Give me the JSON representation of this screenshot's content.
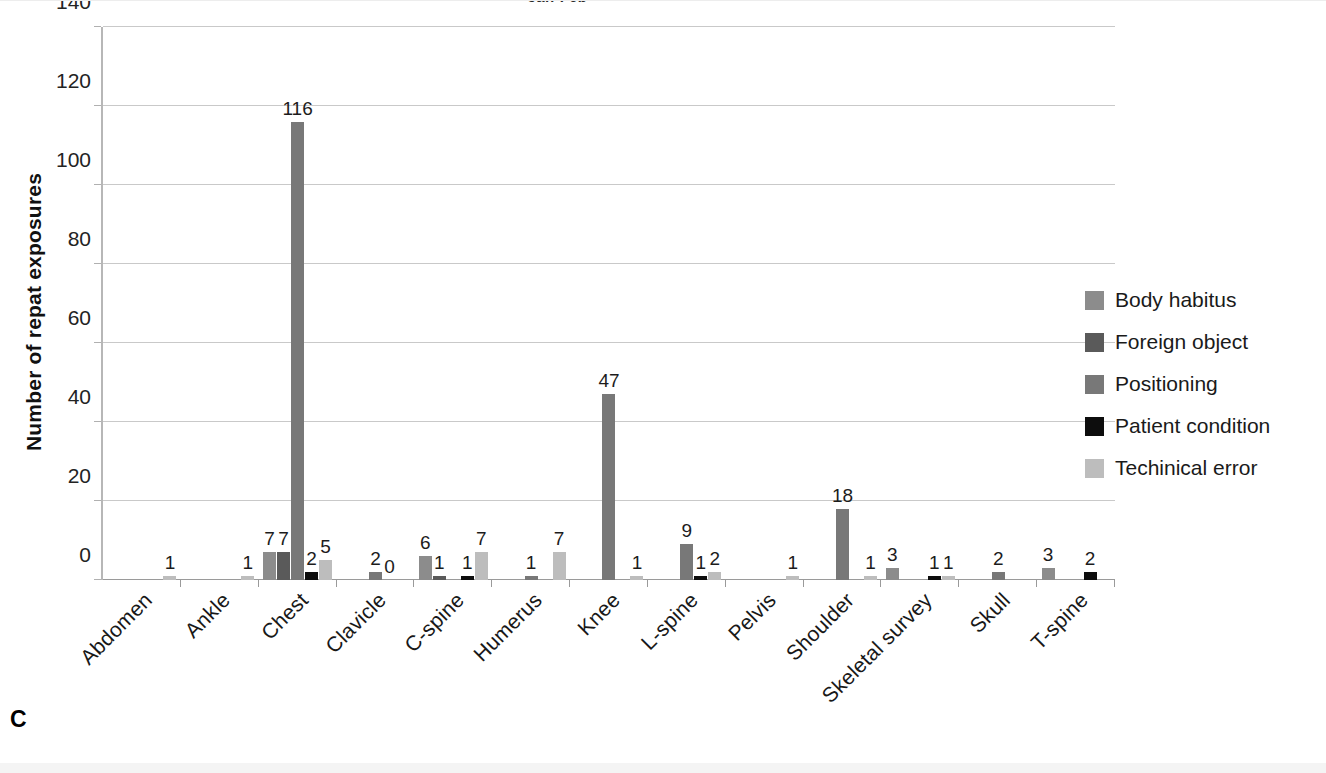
{
  "panel_letter": "C",
  "chart_data": {
    "type": "bar",
    "title": "Jan-Feb",
    "xlabel": "",
    "ylabel": "Number of repat exposures",
    "ylim": [
      0,
      140
    ],
    "yticks": [
      0,
      20,
      40,
      60,
      80,
      100,
      120,
      140
    ],
    "grid": true,
    "legend_position": "right",
    "grouped": true,
    "categories": [
      "Abdomen",
      "Ankle",
      "Chest",
      "Clavicle",
      "C-spine",
      "Humerus",
      "Knee",
      "L-spine",
      "Pelvis",
      "Shoulder",
      "Skeletal survey",
      "Skull",
      "T-spine"
    ],
    "series": [
      {
        "name": "Body habitus",
        "color": "#8c8c8c",
        "values": [
          0,
          0,
          7,
          0,
          6,
          0,
          0,
          0,
          0,
          0,
          3,
          0,
          3
        ]
      },
      {
        "name": "Foreign object",
        "color": "#5a5a5a",
        "values": [
          0,
          0,
          7,
          0,
          1,
          0,
          0,
          0,
          0,
          0,
          0,
          0,
          0
        ]
      },
      {
        "name": "Positioning",
        "color": "#787878",
        "values": [
          0,
          0,
          116,
          2,
          0,
          1,
          47,
          9,
          0,
          18,
          0,
          2,
          0
        ]
      },
      {
        "name": "Patient condition",
        "color": "#0d0d0d",
        "values": [
          0,
          0,
          2,
          0,
          1,
          0,
          0,
          1,
          0,
          0,
          1,
          0,
          2
        ]
      },
      {
        "name": "Techinical error",
        "color": "#bdbdbd",
        "values": [
          1,
          1,
          5,
          0,
          7,
          7,
          1,
          2,
          1,
          1,
          1,
          0,
          0
        ]
      }
    ],
    "bar_labels": [
      {
        "category": "Abdomen",
        "labels": [
          {
            "series": "Techinical error",
            "text": "1"
          }
        ]
      },
      {
        "category": "Ankle",
        "labels": [
          {
            "series": "Techinical error",
            "text": "1"
          }
        ]
      },
      {
        "category": "Chest",
        "labels": [
          {
            "series": "Body habitus",
            "text": "7"
          },
          {
            "series": "Foreign object",
            "text": "7"
          },
          {
            "series": "Positioning",
            "text": "116"
          },
          {
            "series": "Patient condition",
            "text": "2"
          },
          {
            "series": "Techinical error",
            "text": "5"
          }
        ]
      },
      {
        "category": "Clavicle",
        "labels": [
          {
            "series": "Positioning",
            "text": "2"
          },
          {
            "series": "Patient condition",
            "text": "0"
          }
        ]
      },
      {
        "category": "C-spine",
        "labels": [
          {
            "series": "Body habitus",
            "text": "6"
          },
          {
            "series": "Foreign object",
            "text": "1"
          },
          {
            "series": "Patient condition",
            "text": "1"
          },
          {
            "series": "Techinical error",
            "text": "7"
          }
        ]
      },
      {
        "category": "Humerus",
        "labels": [
          {
            "series": "Positioning",
            "text": "1"
          },
          {
            "series": "Techinical error",
            "text": "7"
          }
        ]
      },
      {
        "category": "Knee",
        "labels": [
          {
            "series": "Positioning",
            "text": "47"
          },
          {
            "series": "Techinical error",
            "text": "1"
          }
        ]
      },
      {
        "category": "L-spine",
        "labels": [
          {
            "series": "Positioning",
            "text": "9"
          },
          {
            "series": "Patient condition",
            "text": "1"
          },
          {
            "series": "Techinical error",
            "text": "2"
          }
        ]
      },
      {
        "category": "Pelvis",
        "labels": [
          {
            "series": "Techinical error",
            "text": "1"
          }
        ]
      },
      {
        "category": "Shoulder",
        "labels": [
          {
            "series": "Positioning",
            "text": "18"
          },
          {
            "series": "Techinical error",
            "text": "1"
          }
        ]
      },
      {
        "category": "Skeletal survey",
        "labels": [
          {
            "series": "Body habitus",
            "text": "3"
          },
          {
            "series": "Patient condition",
            "text": "1"
          },
          {
            "series": "Techinical error",
            "text": "1"
          }
        ]
      },
      {
        "category": "Skull",
        "labels": [
          {
            "series": "Positioning",
            "text": "2"
          }
        ]
      },
      {
        "category": "T-spine",
        "labels": [
          {
            "series": "Body habitus",
            "text": "3"
          },
          {
            "series": "Patient condition",
            "text": "2"
          }
        ]
      }
    ]
  }
}
